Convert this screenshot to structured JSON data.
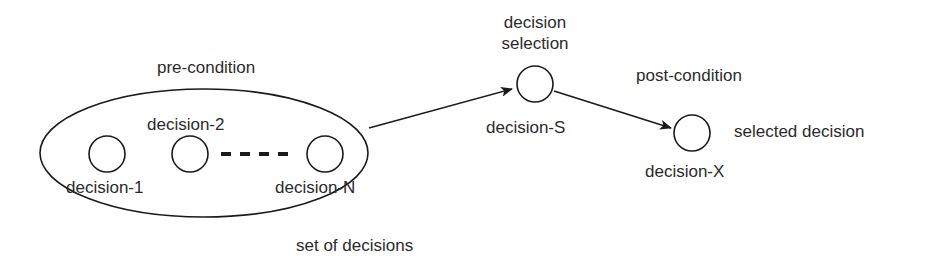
{
  "diagram": {
    "labels": {
      "pre_condition": "pre-condition",
      "set_of_decisions": "set of decisions",
      "decision_1": "decision-1",
      "decision_2": "decision-2",
      "decision_n": "decision-N",
      "decision_selection_line1": "decision",
      "decision_selection_line2": "selection",
      "decision_s": "decision-S",
      "post_condition": "post-condition",
      "decision_x": "decision-X",
      "selected_decision": "selected decision"
    },
    "colors": {
      "stroke": "#1a1a1a",
      "text": "#2b2b2b",
      "background": "#ffffff"
    }
  }
}
